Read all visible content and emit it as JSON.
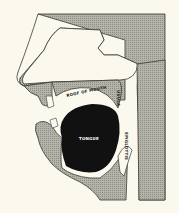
{
  "diagram": {
    "colors": {
      "background": "#fbf9ee",
      "tissue": "#a9a9a1",
      "outline": "#3a3a36",
      "tongue": "#111111"
    },
    "labels": {
      "roof_of_mouth": "ROOF OF MOUTH",
      "uvula": "UVULA",
      "tongue": "TONGUE",
      "epiglottis": "EPIGLOTTIS"
    }
  }
}
